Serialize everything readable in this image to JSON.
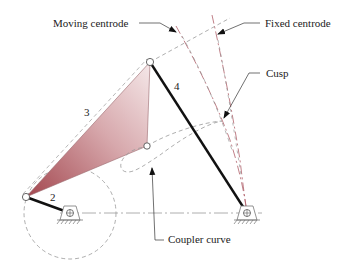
{
  "figure": {
    "type": "four-bar linkage with centrodes and coupler curve",
    "labels": {
      "moving_centrode": "Moving centrode",
      "fixed_centrode": "Fixed centrode",
      "cusp": "Cusp",
      "coupler_curve": "Coupler curve"
    },
    "link_numbers": {
      "crank": "2",
      "coupler": "3",
      "rocker": "4"
    },
    "colors": {
      "link": "#111111",
      "construction": "#888888",
      "centrode": "#b0606a",
      "coupler_fill_dark": "#a3474f",
      "coupler_fill_light": "#f3e3e4",
      "text": "#222222"
    }
  }
}
